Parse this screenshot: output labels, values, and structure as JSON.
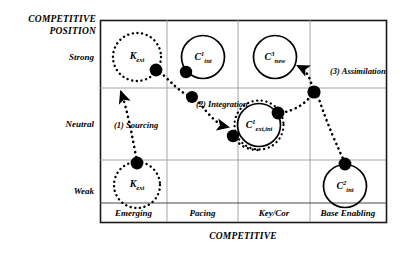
{
  "axes": {
    "y_title_line1": "COMPETITIVE",
    "y_title_line2": "POSITION",
    "x_title": "COMPETITIVE",
    "y_ticks": [
      "Strong",
      "Neutral",
      "Weak"
    ],
    "x_ticks": [
      "Emerging",
      "Pacing",
      "Key/Cor",
      "Base Enabling"
    ]
  },
  "nodes": [
    {
      "id": "k-ext-strong",
      "base": "K",
      "sup": "",
      "sub": "ext",
      "style": "dotted"
    },
    {
      "id": "c1-int",
      "base": "C",
      "sup": "1",
      "sub": "int",
      "style": "solid"
    },
    {
      "id": "c3-new",
      "base": "C",
      "sup": "3",
      "sub": "new",
      "style": "solid"
    },
    {
      "id": "c1-ext-int",
      "base": "C",
      "sup": "1",
      "sub": "ext,int",
      "style": "both"
    },
    {
      "id": "c2-int",
      "base": "C",
      "sup": "2",
      "sub": "int",
      "style": "solid"
    },
    {
      "id": "k-ext-weak",
      "base": "K",
      "sup": "",
      "sub": "ext",
      "style": "dotted"
    }
  ],
  "flows": [
    {
      "id": "sourcing",
      "label": "(1) Sourcing"
    },
    {
      "id": "integration",
      "label": "(2) Integration"
    },
    {
      "id": "assimilation",
      "label": "(3) Assimilation"
    }
  ],
  "colors": {
    "frame": "#1a1a1a",
    "grid": "#9a9a9a",
    "ink": "#000000",
    "background": "#ffffff"
  }
}
